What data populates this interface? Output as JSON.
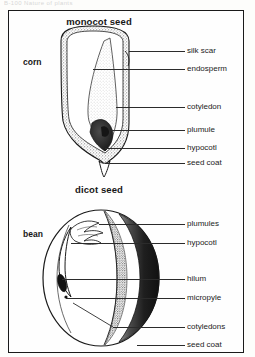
{
  "running_header": "B-100    Nature of plants",
  "figure": {
    "panels": [
      {
        "id": "monocot",
        "title": "monocot seed",
        "organism": "corn",
        "labels": [
          {
            "name": "silk scar",
            "text": "silk scar"
          },
          {
            "name": "endosperm",
            "text": "endosperm"
          },
          {
            "name": "cotyledon",
            "text": "cotyledon"
          },
          {
            "name": "plumule",
            "text": "plumule"
          },
          {
            "name": "hypocotl",
            "text": "hypocotl"
          },
          {
            "name": "seed-coat",
            "text": "seed coat"
          }
        ]
      },
      {
        "id": "dicot",
        "title": "dicot seed",
        "organism": "bean",
        "labels": [
          {
            "name": "plumules",
            "text": "plumules"
          },
          {
            "name": "hypocotl",
            "text": "hypocotl"
          },
          {
            "name": "hilum",
            "text": "hilum"
          },
          {
            "name": "micropyle",
            "text": "micropyle"
          },
          {
            "name": "cotyledons",
            "text": "cotyledons"
          },
          {
            "name": "seed-coat",
            "text": "seed coat"
          }
        ]
      }
    ]
  },
  "colors": {
    "ink": "#1a1a1a",
    "leader": "#2b2b2b",
    "paper": "#fefefe",
    "coat_dark": "#2a2a2a",
    "stipple": "#9a9a9a",
    "endosperm": "#ffffff"
  }
}
